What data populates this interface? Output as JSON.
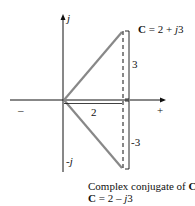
{
  "diagram": {
    "type": "complex-plane",
    "axis_labels": {
      "imag_pos": "j",
      "imag_neg": "-j",
      "real_neg": "–",
      "real_pos": "+"
    },
    "vector": {
      "label_bold": "C",
      "label_rest": " = 2 + ",
      "label_j": "j",
      "label_num": "3",
      "real": 2,
      "imag": 3
    },
    "conjugate": {
      "caption_text": "Complex conjugate of ",
      "caption_bold": "C",
      "label_bold": "C",
      "label_rest": " = 2 – ",
      "label_j": "j",
      "label_num": "3",
      "real": 2,
      "imag": -3
    },
    "dimension_labels": {
      "real_part": "2",
      "imag_pos": "3",
      "imag_neg": "-3"
    },
    "colors": {
      "axis": "#111111",
      "vector": "#888888",
      "dashed": "#111111"
    }
  }
}
